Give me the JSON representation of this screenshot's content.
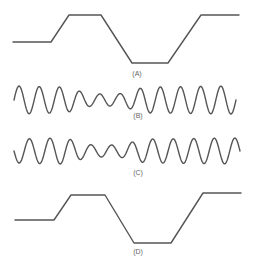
{
  "diagram": {
    "panels": [
      {
        "id": "A",
        "label": "(A)",
        "type": "trapezoidal-envelope",
        "points": [
          [
            13,
            42
          ],
          [
            51,
            42
          ],
          [
            69,
            15
          ],
          [
            101,
            15
          ],
          [
            132,
            63
          ],
          [
            168,
            63
          ],
          [
            201,
            15
          ],
          [
            239,
            15
          ]
        ],
        "label_pos": [
          137,
          70
        ]
      },
      {
        "id": "B",
        "label": "(B)",
        "type": "modulated-carrier",
        "x_range": [
          14,
          236
        ],
        "center_y": 100,
        "cycles": 11,
        "phase": 0,
        "amplitudes": [
          [
            14,
            14
          ],
          [
            60,
            13
          ],
          [
            95,
            6
          ],
          [
            115,
            6
          ],
          [
            150,
            13
          ],
          [
            236,
            14
          ]
        ],
        "label_pos": [
          138,
          112
        ]
      },
      {
        "id": "C",
        "label": "(C)",
        "type": "modulated-carrier",
        "x_range": [
          14,
          240
        ],
        "center_y": 151,
        "cycles": 11,
        "phase": 3.14159,
        "amplitudes": [
          [
            14,
            12
          ],
          [
            60,
            13
          ],
          [
            95,
            6
          ],
          [
            115,
            6
          ],
          [
            150,
            12
          ],
          [
            240,
            13
          ]
        ],
        "label_pos": [
          138,
          169
        ]
      },
      {
        "id": "D",
        "label": "(D)",
        "type": "trapezoidal-envelope",
        "points": [
          [
            15,
            220
          ],
          [
            54,
            220
          ],
          [
            71,
            195
          ],
          [
            105,
            195
          ],
          [
            134,
            243
          ],
          [
            171,
            243
          ],
          [
            203,
            193
          ],
          [
            241,
            193
          ]
        ],
        "label_pos": [
          138,
          248
        ]
      }
    ],
    "stroke_color": "#555555",
    "label_color": "#666666",
    "background": "#ffffff"
  }
}
